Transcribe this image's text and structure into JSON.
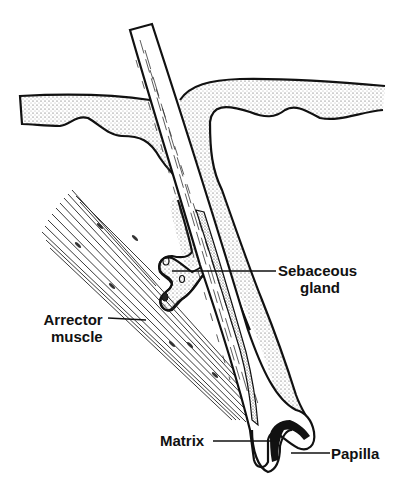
{
  "figure": {
    "colors": {
      "ink": "#111111",
      "background": "#ffffff",
      "stipple": "#555555"
    }
  },
  "labels": {
    "sebaceous_gland": {
      "line1": "Sebaceous",
      "line2": "gland"
    },
    "arrector_muscle": {
      "line1": "Arrector",
      "line2": "muscle"
    },
    "matrix": "Matrix",
    "papilla": "Papilla"
  }
}
